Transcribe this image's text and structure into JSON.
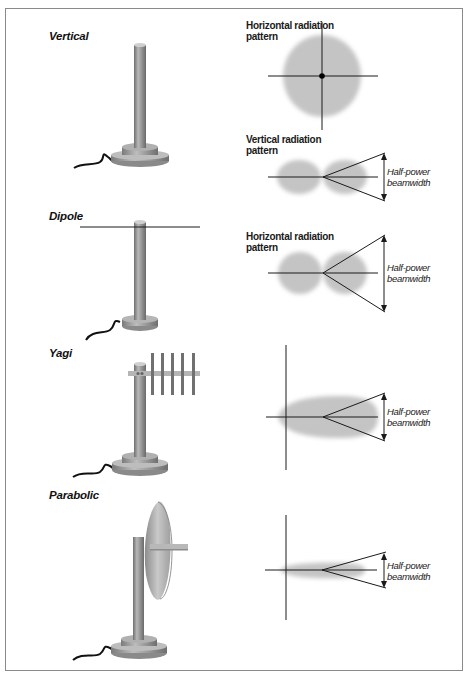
{
  "figure": {
    "antennas": [
      {
        "id": "vertical",
        "label": "Vertical"
      },
      {
        "id": "dipole",
        "label": "Dipole"
      },
      {
        "id": "yagi",
        "label": "Yagi"
      },
      {
        "id": "parabolic",
        "label": "Parabolic"
      }
    ],
    "patterns": {
      "vertical_horizontal": "Horizontal radiation pattern",
      "vertical_vertical": "Vertical radiation pattern",
      "dipole_horizontal": "Horizontal radiation pattern"
    },
    "pattern_labels": {
      "vertical_horizontal_line1": "Horizontal radiation",
      "vertical_horizontal_line2": "pattern",
      "vertical_vertical_line1": "Vertical radiation",
      "vertical_vertical_line2": "pattern",
      "dipole_horizontal_line1": "Horizontal radiation",
      "dipole_horizontal_line2": "pattern"
    },
    "beamwidth": {
      "line1": "Half-power",
      "line2": "beamwidth"
    },
    "colors": {
      "lobe": "#c4c4c4",
      "mast": "#8e8e8e",
      "line": "#1a1a1a",
      "frame": "#8a8a8a"
    }
  }
}
